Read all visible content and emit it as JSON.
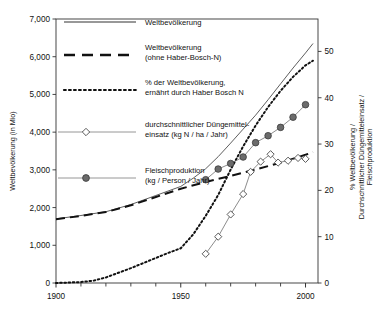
{
  "chart_data": {
    "type": "line",
    "title": "",
    "subtitle": "",
    "xlabel": "",
    "ylabel": "Weltbevölkerung (in Mio)",
    "y2label": "% Weltbevölkerung / Durchschnittlicher Düngemitteleinsatz / Fleischproduktion",
    "xlim": [
      1900,
      2005
    ],
    "ylim": [
      0,
      7000
    ],
    "y2lim": [
      0,
      57
    ],
    "grid": false,
    "legend_position": "top-left-inside",
    "xticks": [
      1900,
      1950,
      2000
    ],
    "xticklabels": [
      "1900",
      "1950",
      "2000"
    ],
    "xminorticks": [
      1910,
      1920,
      1930,
      1940,
      1960,
      1970,
      1980,
      1990
    ],
    "yticks": [
      0,
      1000,
      2000,
      3000,
      4000,
      5000,
      6000,
      7000
    ],
    "yticklabels": [
      "0",
      "1,000",
      "2,000",
      "3,000",
      "4,000",
      "5,000",
      "6,000",
      "7,000"
    ],
    "y2ticks": [
      0,
      10,
      20,
      30,
      40,
      50
    ],
    "y2ticklabels": [
      "0",
      "10",
      "20",
      "30",
      "40",
      "50"
    ],
    "series": [
      {
        "name": "Weltbevölkerung",
        "axis": "left",
        "style": "solid",
        "marker": "none",
        "color": "#555555",
        "x": [
          1900,
          1910,
          1920,
          1930,
          1940,
          1950,
          1955,
          1960,
          1965,
          1970,
          1975,
          1980,
          1985,
          1990,
          1995,
          2000,
          2003
        ],
        "y": [
          1700,
          1790,
          1890,
          2080,
          2320,
          2560,
          2780,
          3030,
          3350,
          3710,
          4080,
          4450,
          4860,
          5280,
          5700,
          6100,
          6350
        ]
      },
      {
        "name": "Weltbevölkerung (ohne Haber-Bosch-N)",
        "axis": "left",
        "style": "dashed",
        "marker": "none",
        "color": "#111111",
        "x": [
          1900,
          1910,
          1920,
          1930,
          1940,
          1950,
          1960,
          1970,
          1980,
          1990,
          2000,
          2003
        ],
        "y": [
          1690,
          1780,
          1880,
          2060,
          2280,
          2500,
          2680,
          2840,
          3010,
          3190,
          3400,
          3470
        ]
      },
      {
        "name": "% der Weltbevölkerung, ernährt durch Haber Bosch N",
        "axis": "right",
        "style": "dotted",
        "marker": "none",
        "color": "#111111",
        "x": [
          1900,
          1910,
          1915,
          1920,
          1925,
          1930,
          1935,
          1940,
          1945,
          1950,
          1955,
          1960,
          1965,
          1970,
          1975,
          1980,
          1985,
          1990,
          1995,
          2000,
          2003
        ],
        "y": [
          0,
          0.2,
          0.5,
          1.2,
          2.2,
          3.2,
          4.3,
          5.4,
          6.5,
          7.5,
          10.5,
          14.5,
          19.0,
          24.5,
          29.5,
          34.0,
          38.0,
          41.5,
          44.5,
          47.0,
          48.0
        ]
      },
      {
        "name": "durchschnittlicher Düngemitteleinsatz (kg N / ha / Jahr)",
        "axis": "right",
        "style": "solid-thin",
        "marker": "open-diamond",
        "color": "#777777",
        "x": [
          1960,
          1965,
          1970,
          1975,
          1978,
          1982,
          1986,
          1989,
          1993,
          1997,
          2000
        ],
        "y": [
          6.3,
          10.0,
          14.8,
          19.2,
          24.0,
          26.2,
          27.8,
          26.0,
          26.4,
          27.0,
          26.8
        ]
      },
      {
        "name": "Fleischproduktion (kg / Person / Jahr)",
        "axis": "right",
        "style": "solid-thin",
        "marker": "filled-circle",
        "color": "#777777",
        "x": [
          1960,
          1965,
          1970,
          1975,
          1980,
          1985,
          1990,
          1995,
          2000
        ],
        "y": [
          22.3,
          24.6,
          25.8,
          27.2,
          30.3,
          31.8,
          33.6,
          35.8,
          38.5
        ]
      }
    ],
    "legend": [
      {
        "label_line1": "Weltbevölkerung",
        "label_line2": "",
        "style": "solid",
        "marker": "none"
      },
      {
        "label_line1": "Weltbevölkerung",
        "label_line2": "(ohne Haber-Bosch-N)",
        "style": "dashed",
        "marker": "none"
      },
      {
        "label_line1": "% der Weltbevölkerung,",
        "label_line2": "ernährt durch Haber Bosch N",
        "style": "dotted",
        "marker": "none"
      },
      {
        "label_line1": "durchschnittlicher Düngemittel-",
        "label_line2": "einsatz (kg N / ha / Jahr)",
        "style": "solid-thin",
        "marker": "open-diamond"
      },
      {
        "label_line1": "Fleischproduktion",
        "label_line2": "(kg / Person / Jahr)",
        "style": "solid-thin",
        "marker": "filled-circle"
      }
    ],
    "colors": {
      "axis": "#333333",
      "population_solid": "#555555",
      "population_dashed": "#111111",
      "percent_dotted": "#111111",
      "fertilizer": "#777777",
      "meat": "#777777",
      "marker_fill": "#6b6b6b",
      "background": "#ffffff"
    }
  }
}
